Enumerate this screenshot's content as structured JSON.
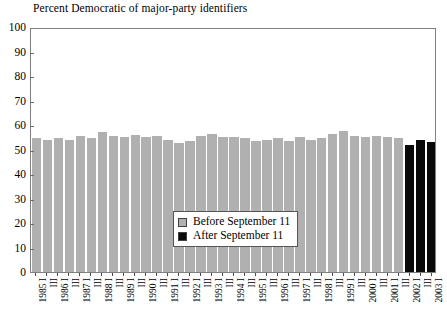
{
  "chart_data": {
    "type": "bar",
    "title": "Percent Democratic of major-party identifiers",
    "xlabel": "",
    "ylabel": "",
    "ylim": [
      0,
      100
    ],
    "ytick_step": 10,
    "yticks": [
      0,
      10,
      20,
      30,
      40,
      50,
      60,
      70,
      80,
      90,
      100
    ],
    "grid": false,
    "legend_position": "inside-center",
    "categories": [
      "1985 I",
      "III",
      "1986 I",
      "III",
      "1987 I",
      "III",
      "1988 I",
      "III",
      "1989 I",
      "III",
      "1990 I",
      "III",
      "1991 I",
      "III",
      "1992 I",
      "III",
      "1993 I",
      "III",
      "1994 I",
      "III",
      "1995 I",
      "III",
      "1996 I",
      "III",
      "1997 I",
      "III",
      "1998 I",
      "III",
      "1999 I",
      "III",
      "2000 I",
      "III",
      "2001 I",
      "III",
      "2002 I",
      "III",
      "2003 I"
    ],
    "series": [
      {
        "name": "Before September 11",
        "color": "#b0b0b0",
        "values": [
          54.5,
          54.0,
          54.5,
          54.0,
          55.5,
          54.5,
          57.0,
          55.5,
          55.0,
          56.0,
          55.0,
          55.5,
          54.0,
          52.5,
          53.5,
          55.5,
          56.5,
          55.0,
          55.0,
          54.5,
          53.5,
          54.0,
          54.5,
          53.5,
          55.0,
          54.0,
          54.5,
          56.5,
          57.5,
          55.5,
          55.0,
          55.5,
          55.0,
          54.5,
          null,
          null,
          null
        ]
      },
      {
        "name": "After September 11",
        "color": "#0a0a0a",
        "values": [
          null,
          null,
          null,
          null,
          null,
          null,
          null,
          null,
          null,
          null,
          null,
          null,
          null,
          null,
          null,
          null,
          null,
          null,
          null,
          null,
          null,
          null,
          null,
          null,
          null,
          null,
          null,
          null,
          null,
          null,
          null,
          null,
          null,
          null,
          52.0,
          54.0,
          53.0
        ]
      }
    ],
    "legend_entries": [
      {
        "label": "Before September 11",
        "color": "#b0b0b0"
      },
      {
        "label": "After September 11",
        "color": "#0a0a0a"
      }
    ]
  }
}
